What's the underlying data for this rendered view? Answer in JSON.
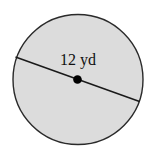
{
  "diagram": {
    "shape": "circle",
    "label": "12 yd",
    "measurement": "diameter",
    "value": 12,
    "unit": "yd",
    "colors": {
      "fill": "#dcdcdc",
      "stroke": "#2a2a2a",
      "center_dot": "#000000",
      "text": "#111111"
    }
  }
}
